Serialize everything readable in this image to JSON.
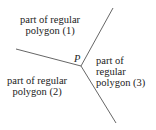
{
  "diagram": {
    "vertex_label": "P",
    "regions": [
      {
        "line1": "part of regular",
        "line2": "polygon (1)"
      },
      {
        "line1": "part of regular",
        "line2": "polygon (2)"
      },
      {
        "line1": "part of",
        "line2": "regular",
        "line3": "polygon (3)"
      }
    ],
    "line_color": "#555555"
  }
}
